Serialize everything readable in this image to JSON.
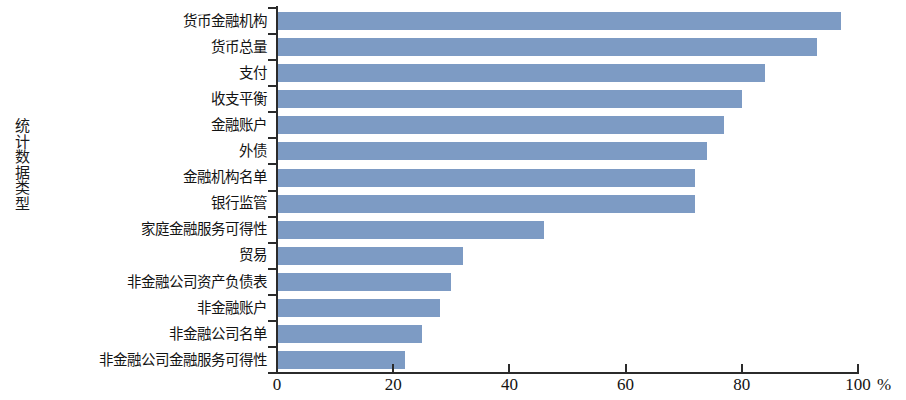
{
  "chart_data": {
    "type": "bar",
    "orientation": "horizontal",
    "title": "",
    "xlabel": "%",
    "ylabel": "统计数据类型",
    "xlim": [
      0,
      100
    ],
    "xticks": [
      0,
      20,
      40,
      60,
      80,
      100
    ],
    "xtick_labels": [
      "0",
      "20",
      "40",
      "60",
      "80",
      "100"
    ],
    "grid": false,
    "legend": null,
    "bar_color": "#7d9bc4",
    "axis_color": "#2b2b2b",
    "categories": [
      "货币金融机构",
      "货币总量",
      "支付",
      "收支平衡",
      "金融账户",
      "外债",
      "金融机构名单",
      "银行监管",
      "家庭金融服务可得性",
      "贸易",
      "非金融公司资产负债表",
      "非金融账户",
      "非金融公司名单",
      "非金融公司金融服务可得性"
    ],
    "values": [
      97,
      93,
      84,
      80,
      77,
      74,
      72,
      72,
      46,
      32,
      30,
      28,
      25,
      22
    ]
  }
}
